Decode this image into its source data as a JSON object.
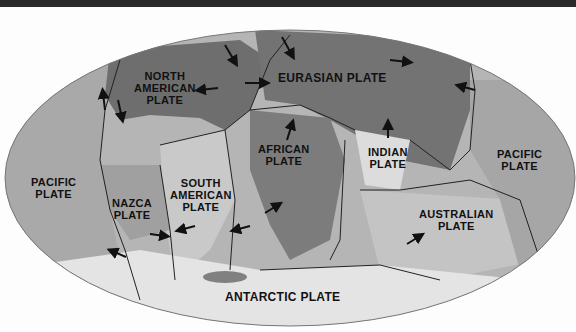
{
  "map": {
    "title": "Tectonic Plates",
    "projection": "elliptical world map",
    "colors": {
      "ocean_light": "#b9b9b9",
      "ocean_mid": "#a3a3a3",
      "land_dark": "#6f6f6f",
      "antarctic": "#e6e6e6",
      "boundary": "#222222",
      "text": "#111111"
    },
    "plates": [
      {
        "id": "north-american",
        "line1": "NORTH",
        "line2": "AMERICAN",
        "line3": "PLATE"
      },
      {
        "id": "eurasian",
        "line1": "EURASIAN PLATE"
      },
      {
        "id": "african",
        "line1": "AFRICAN",
        "line2": "PLATE"
      },
      {
        "id": "indian",
        "line1": "INDIAN",
        "line2": "PLATE"
      },
      {
        "id": "pacific-west",
        "line1": "PACIFIC",
        "line2": "PLATE"
      },
      {
        "id": "pacific-east",
        "line1": "PACIFIC",
        "line2": "PLATE"
      },
      {
        "id": "nazca",
        "line1": "NAZCA",
        "line2": "PLATE"
      },
      {
        "id": "south-american",
        "line1": "SOUTH",
        "line2": "AMERICAN",
        "line3": "PLATE"
      },
      {
        "id": "australian",
        "line1": "AUSTRALIAN",
        "line2": "PLATE"
      },
      {
        "id": "antarctic",
        "line1": "ANTARCTIC PLATE"
      }
    ],
    "arrow_icon": "plate-motion-arrow"
  }
}
